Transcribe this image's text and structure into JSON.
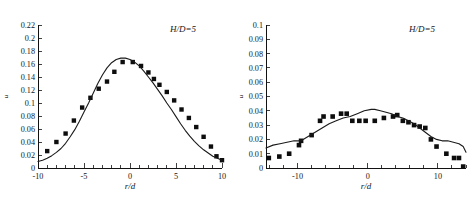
{
  "figure": {
    "background_color": "#ffffff",
    "marker_color": "#0d0d0d",
    "curve_color": "#1a1a1a",
    "axis_color": "#111111"
  },
  "chart_data": [
    {
      "type": "scatter",
      "panel_id": "left",
      "title": "",
      "annotation": "H/D=5",
      "xlabel": "r/d",
      "ylabel": "u",
      "xlim": [
        -10,
        10
      ],
      "ylim": [
        0,
        0.22
      ],
      "grid": false,
      "legend": "none",
      "xticks": [
        -10,
        -5,
        0,
        5,
        10
      ],
      "xtick_labels": [
        "-10",
        "-5",
        "0",
        "5",
        "10"
      ],
      "xminor_step": 1,
      "yticks": [
        0,
        0.02,
        0.04,
        0.06,
        0.08,
        0.1,
        0.12,
        0.14,
        0.16,
        0.18,
        0.2,
        0.22
      ],
      "ytick_labels": [
        "0",
        "0.02",
        "0.04",
        "0.06",
        "0.08",
        "0.1",
        "0.12",
        "0.14",
        "0.16",
        "0.18",
        "0.2",
        "0.22"
      ],
      "series": [
        {
          "name": "experiment",
          "style": "markers",
          "marker": "filled-square",
          "x": [
            -9.0,
            -8.0,
            -7.0,
            -6.1,
            -5.2,
            -4.3,
            -3.4,
            -2.5,
            -1.7,
            -0.8,
            0.3,
            1.2,
            2.0,
            2.6,
            3.2,
            4.0,
            4.8,
            5.6,
            6.4,
            7.2,
            8.0,
            8.8,
            9.4,
            10.0
          ],
          "y": [
            0.026,
            0.04,
            0.053,
            0.073,
            0.093,
            0.108,
            0.122,
            0.133,
            0.148,
            0.163,
            0.163,
            0.157,
            0.147,
            0.137,
            0.128,
            0.117,
            0.104,
            0.09,
            0.077,
            0.063,
            0.048,
            0.033,
            0.018,
            0.012
          ]
        },
        {
          "name": "model",
          "style": "line",
          "x": [
            -10.0,
            -9.5,
            -9.0,
            -8.5,
            -8.0,
            -7.5,
            -7.0,
            -6.5,
            -6.0,
            -5.5,
            -5.0,
            -4.5,
            -4.0,
            -3.5,
            -3.0,
            -2.5,
            -2.0,
            -1.5,
            -1.0,
            -0.5,
            0.0,
            0.5,
            1.0,
            1.5,
            2.0,
            2.5,
            3.0,
            3.5,
            4.0,
            4.5,
            5.0,
            5.5,
            6.0,
            6.5,
            7.0,
            7.5,
            8.0,
            8.5,
            9.0,
            9.5,
            10.0
          ],
          "y": [
            0.01,
            0.012,
            0.015,
            0.019,
            0.024,
            0.03,
            0.038,
            0.048,
            0.059,
            0.072,
            0.086,
            0.1,
            0.115,
            0.13,
            0.143,
            0.154,
            0.162,
            0.167,
            0.169,
            0.169,
            0.167,
            0.163,
            0.157,
            0.149,
            0.14,
            0.131,
            0.121,
            0.111,
            0.1,
            0.09,
            0.079,
            0.068,
            0.058,
            0.049,
            0.041,
            0.034,
            0.028,
            0.023,
            0.018,
            0.015,
            0.012
          ]
        }
      ]
    },
    {
      "type": "scatter",
      "panel_id": "right",
      "title": "",
      "annotation": "H/D=5",
      "xlabel": "r/d",
      "ylabel": "u",
      "xlim": [
        -14.5,
        14.0
      ],
      "ylim": [
        0,
        0.1
      ],
      "grid": false,
      "legend": "none",
      "xticks": [
        -10,
        0,
        10
      ],
      "xtick_labels": [
        "-10",
        "0",
        "10"
      ],
      "xminor_step": 2,
      "yticks": [
        0,
        0.01,
        0.02,
        0.03,
        0.04,
        0.05,
        0.06,
        0.07,
        0.08,
        0.09,
        0.1
      ],
      "ytick_labels": [
        "0",
        "0.01",
        "0.02",
        "0.03",
        "0.04",
        "0.05",
        "0.06",
        "0.07",
        "0.08",
        "0.09",
        "0.1"
      ],
      "series": [
        {
          "name": "experiment",
          "style": "markers",
          "marker": "filled-square",
          "x": [
            -14.1,
            -12.6,
            -11.2,
            -9.8,
            -9.5,
            -8.0,
            -6.8,
            -6.3,
            -5.0,
            -3.8,
            -3.0,
            -2.2,
            -1.2,
            -0.3,
            1.0,
            2.3,
            3.6,
            4.2,
            5.0,
            5.8,
            6.6,
            7.4,
            8.2,
            9.0,
            9.8,
            11.2,
            12.3,
            13.0,
            13.6
          ],
          "y": [
            0.007,
            0.008,
            0.01,
            0.016,
            0.019,
            0.023,
            0.033,
            0.036,
            0.036,
            0.038,
            0.038,
            0.033,
            0.033,
            0.033,
            0.033,
            0.035,
            0.036,
            0.037,
            0.033,
            0.032,
            0.03,
            0.029,
            0.028,
            0.02,
            0.015,
            0.01,
            0.007,
            0.007,
            0.001
          ]
        },
        {
          "name": "model",
          "style": "line",
          "x": [
            -14.5,
            -13.5,
            -12.5,
            -11.5,
            -10.5,
            -9.5,
            -8.5,
            -7.5,
            -6.5,
            -5.5,
            -4.5,
            -3.5,
            -2.5,
            -1.5,
            -0.5,
            0.5,
            1.0,
            1.8,
            2.6,
            3.4,
            4.2,
            5.0,
            5.8,
            6.6,
            7.4,
            8.2,
            9.0,
            9.8,
            10.6,
            11.4,
            12.2,
            13.0,
            13.6,
            14.0
          ],
          "y": [
            0.014,
            0.016,
            0.017,
            0.018,
            0.019,
            0.019,
            0.022,
            0.025,
            0.028,
            0.031,
            0.033,
            0.035,
            0.036,
            0.038,
            0.04,
            0.041,
            0.041,
            0.04,
            0.039,
            0.038,
            0.036,
            0.035,
            0.033,
            0.031,
            0.028,
            0.025,
            0.022,
            0.02,
            0.019,
            0.019,
            0.018,
            0.017,
            0.015,
            0.011
          ]
        }
      ]
    }
  ]
}
